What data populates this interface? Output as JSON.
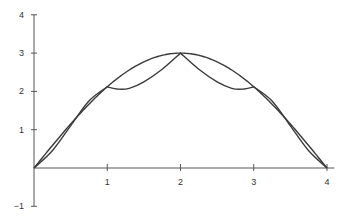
{
  "chart_data": {
    "type": "line",
    "title": "",
    "xlabel": "",
    "ylabel": "",
    "xlim": [
      0,
      4.1
    ],
    "ylim": [
      -1,
      4
    ],
    "grid": false,
    "legend": null,
    "x_ticks": [
      1,
      2,
      3,
      4
    ],
    "x_tick_labels": [
      "1",
      "2",
      "3",
      "4"
    ],
    "y_ticks": [
      4,
      3,
      2,
      1,
      -1
    ],
    "y_tick_labels": [
      "4",
      "3",
      "2",
      "1",
      "−1"
    ],
    "series": [
      {
        "name": "smooth curve (3·sin(πx/4))",
        "x": [
          0,
          0.25,
          0.5,
          0.75,
          1,
          1.25,
          1.5,
          1.75,
          2,
          2.25,
          2.5,
          2.75,
          3,
          3.25,
          3.5,
          3.75,
          4
        ],
        "y": [
          0,
          0.59,
          1.15,
          1.67,
          2.12,
          2.49,
          2.77,
          2.94,
          3,
          2.94,
          2.77,
          2.49,
          2.12,
          1.67,
          1.15,
          0.59,
          0
        ]
      },
      {
        "name": "piecewise interpolant with cusps",
        "x": [
          0,
          0.25,
          0.5,
          0.75,
          1,
          1.15,
          1.3,
          1.5,
          1.75,
          2,
          2.25,
          2.5,
          2.7,
          2.85,
          3,
          3.25,
          3.5,
          3.75,
          4
        ],
        "y": [
          0,
          0.45,
          1.1,
          1.75,
          2.12,
          2.06,
          2.08,
          2.25,
          2.58,
          3,
          2.58,
          2.25,
          2.08,
          2.06,
          2.12,
          1.75,
          1.1,
          0.45,
          0
        ]
      }
    ],
    "colors": {
      "axis": "#555555",
      "curve": "#3a3a3a"
    }
  }
}
